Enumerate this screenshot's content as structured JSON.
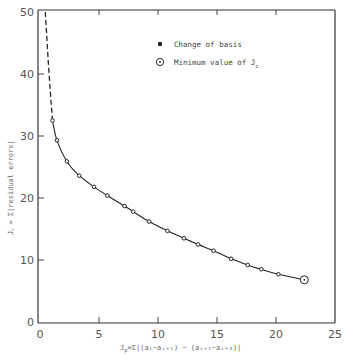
{
  "chart_data": {
    "type": "line",
    "title": "",
    "xlabel": "J_p = Σ_i |(a_i − a_{i+1}) − (a_{i+1} − a_{i+2})|",
    "ylabel": "J_c = Σ|residual errors|",
    "xlim": [
      0,
      25
    ],
    "ylim": [
      0,
      50
    ],
    "xticks": [
      0,
      5,
      10,
      15,
      20,
      25
    ],
    "yticks": [
      0,
      10,
      20,
      30,
      40,
      50
    ],
    "grid": false,
    "legend_position": "upper-center",
    "legend": [
      {
        "marker": "filled-dot",
        "label": "Change of basis"
      },
      {
        "marker": "circled-dot",
        "label": "Minimum value of J_c"
      }
    ],
    "series": [
      {
        "name": "Change of basis",
        "style": "solid-line-with-dot-markers",
        "points": [
          [
            1.06,
            32.5
          ],
          [
            1.44,
            29.3
          ],
          [
            2.28,
            25.9
          ],
          [
            3.33,
            23.6
          ],
          [
            4.58,
            21.8
          ],
          [
            5.7,
            20.4
          ],
          [
            7.17,
            18.7
          ],
          [
            7.9,
            17.8
          ],
          [
            9.25,
            16.2
          ],
          [
            10.8,
            14.7
          ],
          [
            12.2,
            13.5
          ],
          [
            13.4,
            12.5
          ],
          [
            14.7,
            11.5
          ],
          [
            16.2,
            10.2
          ],
          [
            17.6,
            9.2
          ],
          [
            18.75,
            8.5
          ],
          [
            20.2,
            7.7
          ],
          [
            22.4,
            6.8
          ]
        ]
      },
      {
        "name": "Extrapolation",
        "style": "dashed-line",
        "points": [
          [
            0.45,
            50
          ],
          [
            0.7,
            42
          ],
          [
            0.9,
            36.5
          ],
          [
            1.06,
            32.5
          ]
        ]
      },
      {
        "name": "Minimum value of J_c",
        "style": "circled-dot",
        "points": [
          [
            22.4,
            6.8
          ]
        ]
      }
    ]
  },
  "labels": {
    "legend_item_1": "Change of basis",
    "legend_item_2": "Minimum value of J",
    "legend_item_2_sub": "c",
    "xlabel_main": "J",
    "xlabel_sub": "p",
    "xlabel_rest": "=Σ|(a",
    "xlabel_full": "=Σ|(aᵢ−aᵢ₊₁) − (aᵢ₊₁−aᵢ₊₂)|",
    "xlabel_i": "i",
    "ylabel_full": "J꜀ = Σ|residual errors|"
  }
}
